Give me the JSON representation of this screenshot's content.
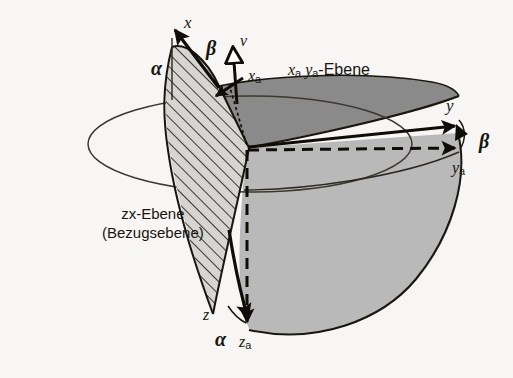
{
  "figure": {
    "kind": "3d-coordinate-diagram",
    "language": "de",
    "background_color": "#f7f6f4",
    "colors": {
      "upper_plane_fill": "#8a8a8a",
      "sphere_fill": "#b9b9b9",
      "hatch_fill": "#d0cfcb",
      "stroke": "#17160f",
      "thin_stroke": "#3a382f",
      "arrow_fill": "#0e0d08",
      "hollow_arrow_fill": "#ffffff"
    }
  },
  "labels": {
    "axis_x": "x",
    "axis_y": "y",
    "axis_z": "z",
    "axis_xa_base": "x",
    "axis_xa_sub": "a",
    "axis_ya_base": "y",
    "axis_ya_sub": "a",
    "axis_za_base": "z",
    "axis_za_sub": "a",
    "vector_v": "v",
    "alpha_upper": "α",
    "alpha_lower": "α",
    "beta_upper": "β",
    "beta_right": "β",
    "plane_xaya_x": "x",
    "plane_xaya_xsub": "a",
    "plane_xaya_y": "y",
    "plane_xaya_ysub": "a",
    "plane_xaya_suffix": "-Ebene",
    "plane_zx_line1": "zx-Ebene",
    "plane_zx_line2": "(Bezugsebene)"
  },
  "annotations": [
    {
      "name": "x-axis-label",
      "text": "x",
      "x": 186,
      "y": 22
    },
    {
      "name": "beta-upper-label",
      "text": "β",
      "x": 208,
      "y": 46
    },
    {
      "name": "v-vector-label",
      "text": "v",
      "x": 240,
      "y": 42
    },
    {
      "name": "alpha-upper-label",
      "text": "α",
      "x": 155,
      "y": 66
    },
    {
      "name": "xa-axis-label",
      "text": "x a",
      "x": 249,
      "y": 77
    },
    {
      "name": "xaya-plane-label",
      "text": "x a y a -Ebene",
      "x": 288,
      "y": 70
    },
    {
      "name": "y-axis-label",
      "text": "y",
      "x": 447,
      "y": 105
    },
    {
      "name": "beta-right-label",
      "text": "β",
      "x": 482,
      "y": 140
    },
    {
      "name": "ya-axis-label",
      "text": "y a",
      "x": 453,
      "y": 168
    },
    {
      "name": "zx-plane-label",
      "text": "zx-Ebene (Bezugsebene)",
      "x": 104,
      "y": 214
    },
    {
      "name": "z-axis-label",
      "text": "z",
      "x": 205,
      "y": 315
    },
    {
      "name": "alpha-lower-label",
      "text": "α",
      "x": 218,
      "y": 338
    },
    {
      "name": "za-axis-label",
      "text": "z a",
      "x": 240,
      "y": 342
    }
  ]
}
